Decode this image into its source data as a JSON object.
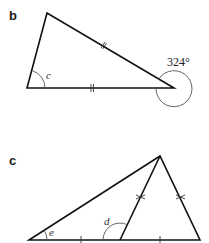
{
  "diagrams": [
    {
      "id": "b",
      "label": "b",
      "shape": "triangle",
      "angles": [
        {
          "name": "c",
          "label": "c",
          "position": "bottom-left interior"
        },
        {
          "name": "reflex",
          "label": "324°",
          "position": "bottom-right exterior"
        }
      ],
      "equal_side_marks": [
        "top-right edge",
        "base"
      ]
    },
    {
      "id": "c",
      "label": "c",
      "shape": "triangle with cevian",
      "angles": [
        {
          "name": "e",
          "label": "e",
          "position": "bottom-left"
        },
        {
          "name": "d",
          "label": "d",
          "position": "inner base vertex, left side"
        }
      ],
      "equal_side_marks": [
        "inner triangle left side",
        "inner triangle right side",
        "base left segment",
        "base right segment"
      ]
    }
  ]
}
